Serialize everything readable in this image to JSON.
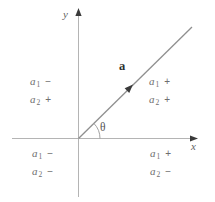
{
  "figure": {
    "axes": {
      "x_label": "x",
      "y_label": "y"
    },
    "vector": {
      "label": "a",
      "angle_label": "θ"
    },
    "colors": {
      "background": "#ffffff",
      "axis": "#b4b4b4",
      "vector_line": "#8f8f8f",
      "arrowhead": "#3a3a3a",
      "angle_arc": "#a2a2a2",
      "label_text": "#6e6e6e",
      "vector_label": "#303030"
    },
    "quadrants": [
      {
        "region": "top-left",
        "lines": [
          {
            "var": "a",
            "sub": "1",
            "sign": "−"
          },
          {
            "var": "a",
            "sub": "2",
            "sign": "+"
          }
        ]
      },
      {
        "region": "top-right",
        "lines": [
          {
            "var": "a",
            "sub": "1",
            "sign": "+"
          },
          {
            "var": "a",
            "sub": "2",
            "sign": "+"
          }
        ]
      },
      {
        "region": "bottom-left",
        "lines": [
          {
            "var": "a",
            "sub": "1",
            "sign": "−"
          },
          {
            "var": "a",
            "sub": "2",
            "sign": "−"
          }
        ]
      },
      {
        "region": "bottom-right",
        "lines": [
          {
            "var": "a",
            "sub": "1",
            "sign": "+"
          },
          {
            "var": "a",
            "sub": "2",
            "sign": "−"
          }
        ]
      }
    ]
  }
}
